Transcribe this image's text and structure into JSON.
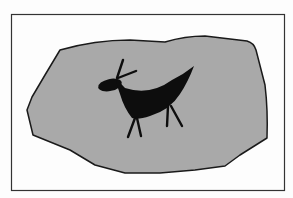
{
  "figure": {
    "description": "Rock painting illustration: a black stylized animal (deer/antelope) with raised curved back and long neck, painted on a gray irregular stone, shown within a rectangular frame",
    "colors": {
      "background": "#fdfdfd",
      "frame": "#333333",
      "stone_fill": "#a9a9a9",
      "stone_outline": "#1a1a1a",
      "figure": "#0d0d0d"
    }
  }
}
